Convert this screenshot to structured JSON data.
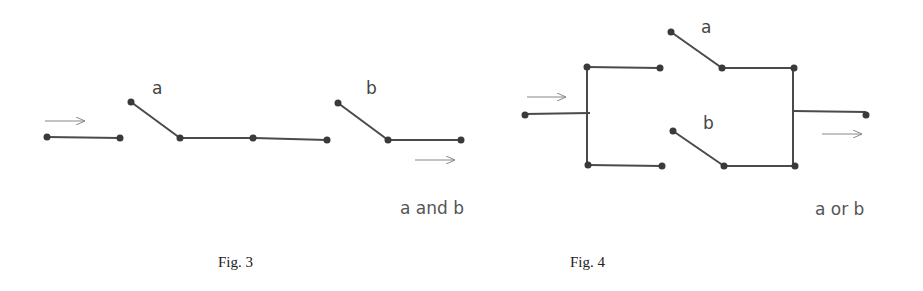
{
  "figures": [
    {
      "caption": "Fig. 3",
      "title": "Series switches",
      "switch_labels": [
        "a",
        "b"
      ],
      "operation": "a and b"
    },
    {
      "caption": "Fig. 4",
      "title": "Parallel switches",
      "switch_labels": [
        "a",
        "b"
      ],
      "operation": "a or b"
    }
  ],
  "colors": {
    "wire": "#4a4a4a",
    "node": "#3a3a3a",
    "arrow": "#888888",
    "text": "#444444"
  }
}
